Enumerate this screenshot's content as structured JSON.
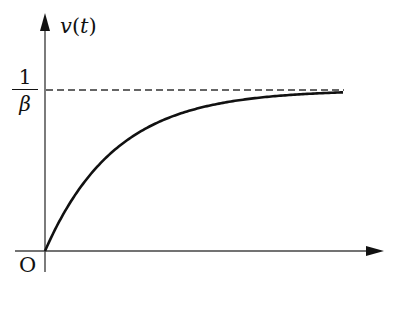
{
  "figure": {
    "y_axis_label": {
      "func": "v",
      "open": "(",
      "arg": "t",
      "close": ")"
    },
    "asymptote_label": {
      "numerator": "1",
      "denominator": "β"
    },
    "origin_label": "O"
  },
  "chart_data": {
    "type": "line",
    "title": "",
    "xlabel": "t",
    "ylabel": "v(t)",
    "series": [
      {
        "name": "v(t)",
        "style": "solid",
        "x": [
          0,
          0.5,
          1,
          1.5,
          2,
          3,
          4,
          5
        ],
        "y": [
          0,
          0.39,
          0.63,
          0.78,
          0.86,
          0.95,
          0.98,
          0.99
        ]
      },
      {
        "name": "asymptote 1/β",
        "style": "dashed",
        "x": [
          0,
          5
        ],
        "y": [
          1,
          1
        ]
      }
    ],
    "y_ticks": [
      "1/β"
    ],
    "origin": "O",
    "grid": false,
    "legend": false
  }
}
